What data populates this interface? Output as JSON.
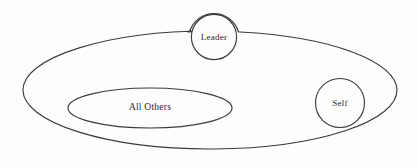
{
  "diagram": {
    "type": "venn-set-diagram",
    "background_color": "#fdfdfc",
    "stroke_color": "#3b3b3f",
    "text_color": "#2e2e32",
    "shapes": {
      "group_boundary": {
        "name": "group-ellipse",
        "label": "",
        "cx": 210,
        "cy": 90,
        "rx": 187,
        "ry": 59
      },
      "leader": {
        "name": "leader-circle",
        "label": "Leader",
        "cx": 214,
        "cy": 37,
        "r": 23,
        "label_x": 214,
        "label_y": 38
      },
      "self": {
        "name": "self-circle",
        "label": "Self",
        "cx": 340,
        "cy": 103,
        "r": 25,
        "label_x": 340,
        "label_y": 104
      },
      "all_others": {
        "name": "all-others-ellipse",
        "label": "All Others",
        "cx": 150,
        "cy": 108,
        "rx": 82,
        "ry": 20,
        "label_x": 150,
        "label_y": 108
      }
    }
  }
}
